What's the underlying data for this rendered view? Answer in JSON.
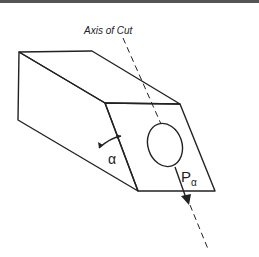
{
  "diagram": {
    "axis_label": "Axis of Cut",
    "angle_label": "α",
    "force_label_main": "P",
    "force_label_sub": "α",
    "line_color": "#222222",
    "background": "#ffffff"
  }
}
